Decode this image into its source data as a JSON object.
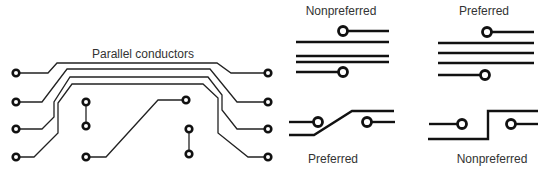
{
  "labels": {
    "parallel": "Parallel conductors",
    "top_left": "Nonpreferred",
    "top_right": "Preferred",
    "bottom_left": "Preferred",
    "bottom_right": "Nonpreferred"
  },
  "colors": {
    "trace": "#111111",
    "text": "#333333",
    "background": "#ffffff"
  }
}
